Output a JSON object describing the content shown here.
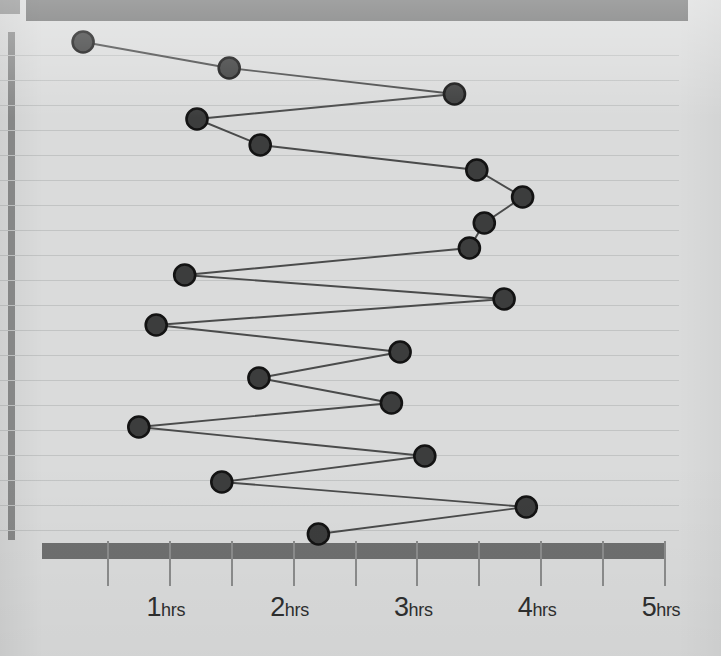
{
  "chart_data": {
    "type": "line",
    "title": "",
    "subtitle": "",
    "xlabel": "",
    "ylabel": "",
    "orientation": "horizontal-time-series",
    "grid": true,
    "legend": null,
    "legend_position": "none",
    "xlim": [
      0,
      5
    ],
    "x_tick_values": [
      0.5,
      1,
      1.5,
      2,
      2.5,
      3,
      3.5,
      4,
      4.5,
      5
    ],
    "x_tick_labels": [
      {
        "num": "",
        "unit": ""
      },
      {
        "num": "1",
        "unit": "hrs"
      },
      {
        "num": "",
        "unit": ""
      },
      {
        "num": "2",
        "unit": "hrs"
      },
      {
        "num": "",
        "unit": ""
      },
      {
        "num": "3",
        "unit": "hrs"
      },
      {
        "num": "",
        "unit": ""
      },
      {
        "num": "4",
        "unit": "hrs"
      },
      {
        "num": "",
        "unit": ""
      },
      {
        "num": "5",
        "unit": "hrs"
      }
    ],
    "x_unit": "hrs",
    "ylim": [
      0,
      20
    ],
    "y_tick_labels": [],
    "gridline_count": 20,
    "series": [
      {
        "name": "duration",
        "marker": "circle",
        "values": [
          0.3,
          1.48,
          3.3,
          1.22,
          1.73,
          3.48,
          3.85,
          3.54,
          3.42,
          1.12,
          3.7,
          0.89,
          2.86,
          1.72,
          2.79,
          0.75,
          3.06,
          1.42,
          3.88,
          2.2
        ]
      }
    ],
    "colors": {
      "background": "#dadbdb",
      "band": "#6e6f6f",
      "axis_bar": "#8b8c8c",
      "gridline": "#c2c4c4",
      "marker_fill": "#3c3d3d",
      "marker_stroke": "#131313",
      "line": "#4a4b4b",
      "label_text": "#2e2f2f"
    }
  },
  "layout": {
    "x_pixel_origin": 46,
    "x_pixels_per_hour": 123.8,
    "y_first_gridline": 55,
    "y_gridline_spacing": 25.0,
    "point_y_positions": [
      42,
      68,
      94,
      119,
      145,
      170,
      197,
      223,
      248,
      275,
      299,
      325,
      352,
      378,
      403,
      427,
      456,
      482,
      507,
      534
    ],
    "point_x_positions": [
      83,
      229,
      452,
      197,
      260,
      474,
      520,
      482,
      468,
      185,
      503,
      156,
      398,
      293,
      389,
      138,
      422,
      218,
      523,
      314
    ]
  }
}
